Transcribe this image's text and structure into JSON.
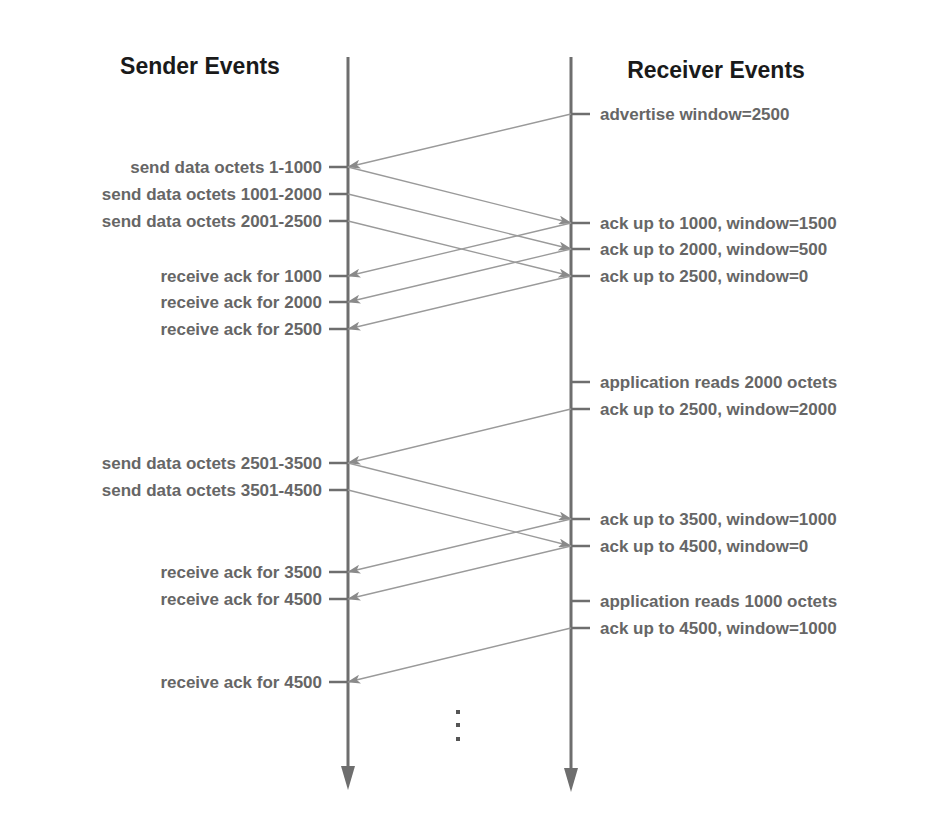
{
  "diagram": {
    "sender_title": "Sender Events",
    "receiver_title": "Receiver Events",
    "ellipsis": "⋮",
    "colors": {
      "timeline": "#6e6e6e",
      "message_line": "#9a9a9a",
      "label_text": "#666666",
      "title_text": "#1a1a1a"
    },
    "sender_events": [
      {
        "label": "send data octets 1-1000",
        "y": 167
      },
      {
        "label": "send data octets 1001-2000",
        "y": 194
      },
      {
        "label": "send data octets 2001-2500",
        "y": 221
      },
      {
        "label": "receive ack for 1000",
        "y": 276
      },
      {
        "label": "receive ack for 2000",
        "y": 302
      },
      {
        "label": "receive ack for 2500",
        "y": 329
      },
      {
        "label": "send data octets 2501-3500",
        "y": 463
      },
      {
        "label": "send data octets 3501-4500",
        "y": 490
      },
      {
        "label": "receive ack for 3500",
        "y": 572
      },
      {
        "label": "receive ack for 4500",
        "y": 599
      },
      {
        "label": "receive ack for 4500",
        "y": 682
      }
    ],
    "receiver_events": [
      {
        "label": "advertise window=2500",
        "y": 114
      },
      {
        "label": "ack up to 1000, window=1500",
        "y": 223
      },
      {
        "label": "ack up to 2000, window=500",
        "y": 249
      },
      {
        "label": "ack up to 2500, window=0",
        "y": 276
      },
      {
        "label": "application reads 2000 octets",
        "y": 382
      },
      {
        "label": "ack up to 2500, window=2000",
        "y": 409
      },
      {
        "label": "ack up to 3500, window=1000",
        "y": 519
      },
      {
        "label": "ack up to 4500, window=0",
        "y": 546
      },
      {
        "label": "application reads 1000 octets",
        "y": 601
      },
      {
        "label": "ack up to 4500, window=1000",
        "y": 628
      }
    ],
    "messages": [
      {
        "from": "receiver",
        "from_y": 114,
        "to_y": 167,
        "desc": "window advertisement 2500"
      },
      {
        "from": "sender",
        "from_y": 167,
        "to_y": 223,
        "desc": "data 1-1000"
      },
      {
        "from": "sender",
        "from_y": 194,
        "to_y": 249,
        "desc": "data 1001-2000"
      },
      {
        "from": "sender",
        "from_y": 221,
        "to_y": 276,
        "desc": "data 2001-2500"
      },
      {
        "from": "receiver",
        "from_y": 223,
        "to_y": 276,
        "desc": "ack 1000"
      },
      {
        "from": "receiver",
        "from_y": 249,
        "to_y": 302,
        "desc": "ack 2000"
      },
      {
        "from": "receiver",
        "from_y": 276,
        "to_y": 329,
        "desc": "ack 2500"
      },
      {
        "from": "receiver",
        "from_y": 409,
        "to_y": 463,
        "desc": "ack 2500 window 2000"
      },
      {
        "from": "sender",
        "from_y": 463,
        "to_y": 519,
        "desc": "data 2501-3500"
      },
      {
        "from": "sender",
        "from_y": 490,
        "to_y": 546,
        "desc": "data 3501-4500"
      },
      {
        "from": "receiver",
        "from_y": 519,
        "to_y": 572,
        "desc": "ack 3500"
      },
      {
        "from": "receiver",
        "from_y": 546,
        "to_y": 599,
        "desc": "ack 4500"
      },
      {
        "from": "receiver",
        "from_y": 628,
        "to_y": 682,
        "desc": "ack 4500 window 1000"
      }
    ]
  }
}
